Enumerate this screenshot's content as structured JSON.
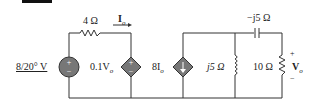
{
  "labels": {
    "source": "8/20° V",
    "r1": "4 Ω",
    "io": "I",
    "io_sub": "o",
    "dep_v": "0.1V",
    "dep_v_sub": "o",
    "dep_i": "8I",
    "dep_i_sub": "o",
    "inductor": "j5 Ω",
    "capacitor": "−j5 Ω",
    "r2": "10 Ω",
    "vo": "V",
    "vo_sub": "o",
    "plus": "+",
    "minus": "−"
  },
  "colors": {
    "wire": "#333333",
    "source_fill": "#777777"
  }
}
